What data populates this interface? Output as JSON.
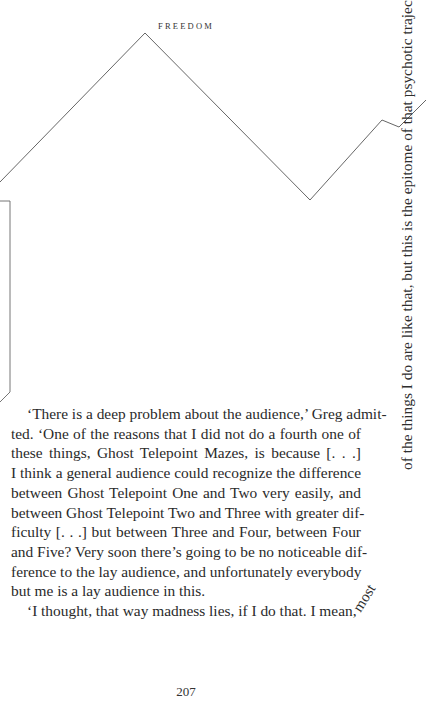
{
  "running_head": "FREEDOM",
  "page_number": "207",
  "figure": {
    "line_color": "#555555"
  },
  "trajectory_text": {
    "vertical": "most of the things I do are like that, but this is the epitome of that psychotic trajectory.’",
    "curve_start": "most",
    "vertical_rest": "of the things I do are like that, but this is the epitome of that psychotic trajectory.’"
  },
  "body": {
    "paragraphs": [
      {
        "lines": [
          "‘There is a deep problem about the audience,’ Greg admit-",
          "ted. ‘One of the reasons that I did not do a fourth one of",
          "these things, Ghost Telepoint Mazes, is because [. . .]",
          "I think a general audience could recognize the difference",
          "between Ghost Telepoint One and Two very easily, and",
          "between Ghost Telepoint Two and Three with greater dif-",
          "ficulty [. . .] but between Three and Four, between Four",
          "and Five? Very soon there’s going to be no noticeable dif-",
          "ference to the lay audience, and unfortunately everybody",
          "but me is a lay audience in this."
        ]
      },
      {
        "lines": [
          "‘I thought, that way madness lies, if I do that. I mean,"
        ]
      }
    ]
  }
}
